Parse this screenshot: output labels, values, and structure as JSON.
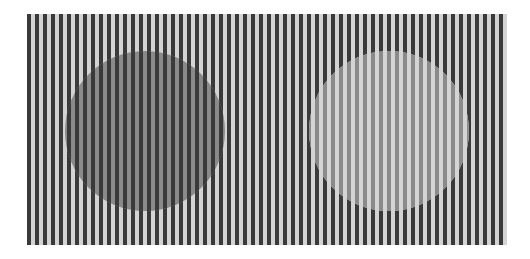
{
  "illusion": {
    "name": "White's illusion / grating brightness illusion",
    "canvas": {
      "width": 530,
      "height": 259,
      "background": "#ffffff"
    },
    "grating": {
      "x": 27,
      "y": 14,
      "width": 480,
      "height": 231,
      "period": 8,
      "dark_width": 4,
      "dark_color": "#3a3a3a",
      "light_color": "#d4d4d4"
    },
    "circles": [
      {
        "id": "left-circle",
        "cx": 145,
        "cy": 131,
        "r": 80,
        "fill": "#8a8a8a",
        "replaces": "light"
      },
      {
        "id": "right-circle",
        "cx": 389,
        "cy": 131,
        "r": 80,
        "fill": "#8a8a8a",
        "replaces": "dark"
      }
    ]
  }
}
